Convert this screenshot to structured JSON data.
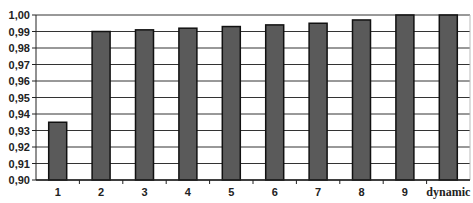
{
  "chart_data": {
    "type": "bar",
    "title": "",
    "xlabel": "",
    "ylabel": "",
    "categories": [
      "1",
      "2",
      "3",
      "4",
      "5",
      "6",
      "7",
      "8",
      "9",
      "dynamic"
    ],
    "values": [
      0.935,
      0.99,
      0.991,
      0.992,
      0.993,
      0.994,
      0.995,
      0.997,
      1.0,
      1.0
    ],
    "ylim": [
      0.9,
      1.0
    ],
    "yticks": [
      "0,90",
      "0,91",
      "0,92",
      "0,93",
      "0,94",
      "0,95",
      "0,96",
      "0,97",
      "0,98",
      "0,99",
      "1,00"
    ],
    "grid": true,
    "legend": null,
    "colors": {
      "bar_fill": "#5a5a5a",
      "bar_stroke": "#111111",
      "grid": "#333333",
      "background": "#ffffff"
    }
  }
}
